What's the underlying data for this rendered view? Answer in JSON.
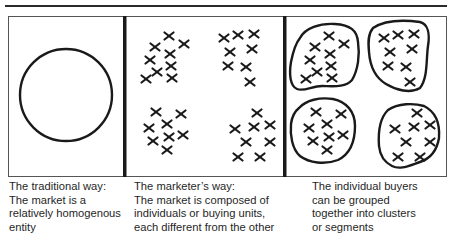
{
  "figure": {
    "panels": [
      {
        "id": "traditional",
        "caption": "The traditional way:\nThe market is a\nrelatively homogenous\nentity",
        "shape": "single-circle"
      },
      {
        "id": "marketer",
        "caption": "The marketer’s way:\nThe market is composed of\nindividuals or buying units,\neach different from the other",
        "shape": "scattered-x-marks"
      },
      {
        "id": "segments",
        "caption": "The individual buyers\ncan be grouped\ntogether into clusters\nor segments",
        "shape": "x-marks-in-outlined-clusters"
      }
    ],
    "marker_glyph": "x-mark",
    "colors": {
      "stroke": "#1a1a1a",
      "frame": "#555555",
      "background": "#ffffff"
    }
  }
}
